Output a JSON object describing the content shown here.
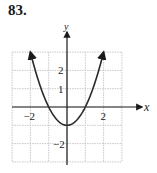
{
  "problem": {
    "number": "83."
  },
  "chart_data": {
    "type": "line",
    "title": "",
    "function": "y = x^2 - 1",
    "xlabel": "x",
    "ylabel": "y",
    "xlim": [
      -3,
      3
    ],
    "ylim": [
      -3,
      3
    ],
    "grid": true,
    "x_tick_labels": [
      {
        "value": -2,
        "label": "−2"
      },
      {
        "value": 2,
        "label": "2"
      }
    ],
    "y_tick_labels": [
      {
        "value": 2,
        "label": "2"
      },
      {
        "value": 1,
        "label": "1"
      },
      {
        "value": -2,
        "label": "−2"
      }
    ],
    "series": [
      {
        "name": "parabola",
        "x": [
          -2,
          -1.5,
          -1,
          -0.5,
          0,
          0.5,
          1,
          1.5,
          2
        ],
        "y": [
          3,
          1.25,
          0,
          -0.75,
          -1,
          -0.75,
          0,
          1.25,
          3
        ],
        "arrows_at_ends": true
      }
    ],
    "colors": {
      "curve": "#2a2a2a",
      "axis": "#1a1a1a",
      "grid": "#c8c8c8"
    }
  }
}
